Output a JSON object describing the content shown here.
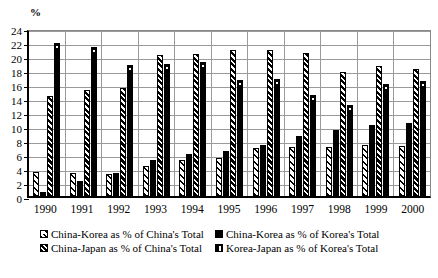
{
  "chart_data": {
    "type": "bar",
    "title": "",
    "xlabel": "",
    "ylabel": "%",
    "unit_label": "%",
    "ylim": [
      0,
      24
    ],
    "ytick_step": 2,
    "yticks": [
      0,
      2,
      4,
      6,
      8,
      10,
      12,
      14,
      16,
      18,
      20,
      22,
      24
    ],
    "grid": true,
    "legend_position": "bottom",
    "categories": [
      "1990",
      "1991",
      "1992",
      "1993",
      "1994",
      "1995",
      "1996",
      "1997",
      "1998",
      "1999",
      "2000"
    ],
    "series": [
      {
        "name": "China-Korea as % of China's Total",
        "pattern": "diagonal-hatch-open",
        "values": [
          3.4,
          3.3,
          3.1,
          4.3,
          5.1,
          5.4,
          6.9,
          7.0,
          7.0,
          7.3,
          7.2
        ]
      },
      {
        "name": "China-Korea as % of Korea's Total",
        "pattern": "solid-black",
        "values": [
          0.6,
          2.2,
          3.3,
          5.1,
          6.0,
          6.4,
          7.3,
          8.6,
          9.4,
          10.2,
          10.5
        ]
      },
      {
        "name": "China-Japan as % of China's Total",
        "pattern": "dense-diagonal-hatch",
        "values": [
          14.3,
          15.1,
          15.4,
          20.1,
          20.3,
          20.8,
          20.8,
          20.4,
          17.7,
          18.6,
          18.1
        ]
      },
      {
        "name": "Korea-Japan as % of Korea's Total",
        "pattern": "solid-black-notch",
        "values": [
          21.8,
          21.3,
          18.7,
          18.8,
          19.2,
          16.6,
          16.7,
          14.5,
          13.0,
          16.0,
          16.5
        ]
      }
    ]
  },
  "legend": {
    "items": [
      {
        "label": "China-Korea as % of China's Total",
        "swatch": "sw1"
      },
      {
        "label": "China-Korea as % of Korea's Total",
        "swatch": "sw2"
      },
      {
        "label": "China-Japan as % of China's Total",
        "swatch": "sw3"
      },
      {
        "label": "Korea-Japan as % of Korea's Total",
        "swatch": "sw4"
      }
    ]
  }
}
